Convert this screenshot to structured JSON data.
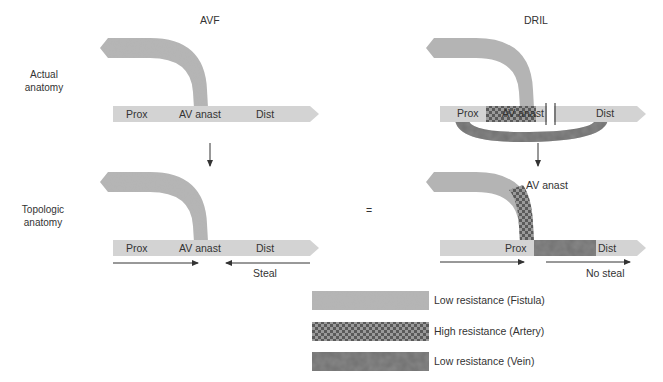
{
  "columns": {
    "left_title": "AVF",
    "right_title": "DRIL"
  },
  "rows": {
    "top_label_line1": "Actual",
    "top_label_line2": "anatomy",
    "bottom_label_line1": "Topologic",
    "bottom_label_line2": "anatomy"
  },
  "equals_sign": "=",
  "avf_actual": {
    "prox": "Prox",
    "anast": "AV anast",
    "dist": "Dist"
  },
  "dril_actual": {
    "prox": "Prox",
    "anast": "AV anast",
    "dist": "Dist"
  },
  "avf_topologic": {
    "prox": "Prox",
    "anast": "AV anast",
    "dist": "Dist",
    "flow_note": "Steal"
  },
  "dril_topologic": {
    "prox": "Prox",
    "anast": "AV anast",
    "dist": "Dist",
    "flow_note": "No steal"
  },
  "legend": [
    {
      "label": "Low resistance (Fistula)",
      "pattern": "solid-light"
    },
    {
      "label": "High resistance (Artery)",
      "pattern": "checker"
    },
    {
      "label": "Low resistance (Vein)",
      "pattern": "mottled-dark"
    }
  ],
  "colors": {
    "fistula": "#b4b4b4",
    "artery_light": "#d3d3d3",
    "checker_dark": "#5e5e5e",
    "checker_light": "#9a9a9a",
    "vein": "#6e6e6e",
    "text": "#333333"
  }
}
